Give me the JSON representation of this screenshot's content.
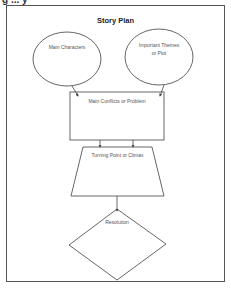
{
  "header": {
    "cut_text": "g  ...  y"
  },
  "diagram": {
    "title": "Story Plan",
    "nodes": [
      {
        "id": "main-characters",
        "shape": "ellipse",
        "label": "Main Characters"
      },
      {
        "id": "themes-plot",
        "shape": "ellipse",
        "label_line1": "Important Themes",
        "label_line2": "or Plot"
      },
      {
        "id": "conflicts",
        "shape": "rectangle",
        "label": "Main Conflicts or Problem"
      },
      {
        "id": "climax",
        "shape": "trapezoid",
        "label": "Turning Point or Climax"
      },
      {
        "id": "resolution",
        "shape": "diamond",
        "label": "Resolution"
      }
    ],
    "edges": [
      {
        "from": "main-characters",
        "to": "conflicts"
      },
      {
        "from": "themes-plot",
        "to": "conflicts"
      },
      {
        "from": "conflicts",
        "to": "climax",
        "count": 2
      },
      {
        "from": "climax",
        "to": "resolution"
      }
    ],
    "colors": {
      "stroke": "#555555",
      "text": "#555555",
      "background": "#ffffff"
    }
  }
}
